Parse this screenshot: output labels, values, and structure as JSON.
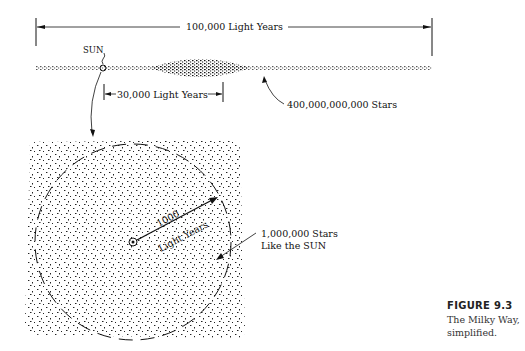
{
  "diagram": {
    "top": {
      "total_width_label": "100,000 Light Years",
      "sun_label": "SUN",
      "sun_distance_label": "30,000 Light Years",
      "star_count_label": "400,000,000,000 Stars"
    },
    "detail": {
      "radius_value": "1000",
      "radius_unit": "Light Years",
      "local_stars_line1": "1,000,000 Stars",
      "local_stars_line2": "Like the SUN"
    }
  },
  "figure": {
    "number": "FIGURE 9.3",
    "caption_line1": "The Milky Way,",
    "caption_line2": "simplified."
  },
  "colors": {
    "ink": "#111111",
    "background": "#ffffff"
  }
}
